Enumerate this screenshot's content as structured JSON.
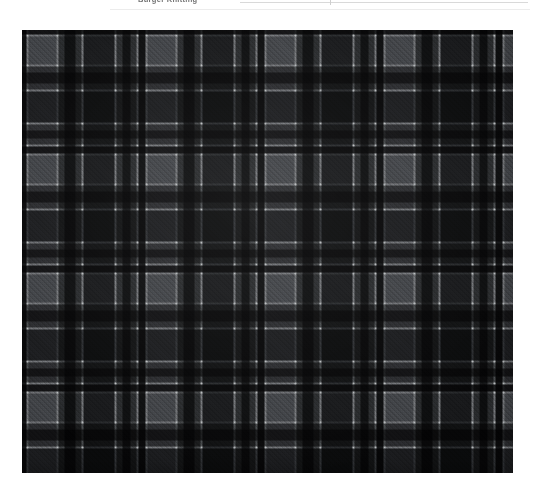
{
  "header": {
    "caption": "Burger Knitting",
    "note": ""
  },
  "swatch": {
    "name": "tartan-plaid-fabric-swatch",
    "alt_text": "Grey and black tartan plaid woven fabric swatch",
    "weave": "2/2 twill",
    "frame": {
      "x": 22,
      "y": 30,
      "width": 491,
      "height": 443
    },
    "palette": {
      "ground_mid_grey": "#6f7173",
      "light_grey": "#7e8083",
      "dark_grey": "#4c4e50",
      "charcoal": "#2c2e31",
      "black": "#17181a",
      "white_line": "#d7d9da",
      "page_background": "#ffffff"
    },
    "sett": {
      "repeat_px": 119,
      "warp_stops": [
        {
          "pos": 0,
          "color": "#17181a",
          "label": "black-guard"
        },
        {
          "pos": 4,
          "color": "#17181a",
          "label": "black-guard"
        },
        {
          "pos": 5,
          "color": "#d7d9da",
          "label": "white-pinstripe"
        },
        {
          "pos": 6,
          "color": "#d7d9da",
          "label": "white-pinstripe"
        },
        {
          "pos": 7,
          "color": "#7e8083",
          "label": "light-grey-field"
        },
        {
          "pos": 34,
          "color": "#7e8083",
          "label": "light-grey-field"
        },
        {
          "pos": 35,
          "color": "#d7d9da",
          "label": "white-pinstripe"
        },
        {
          "pos": 36,
          "color": "#d7d9da",
          "label": "white-pinstripe"
        },
        {
          "pos": 37,
          "color": "#4c4e50",
          "label": "mid-grey"
        },
        {
          "pos": 42,
          "color": "#4c4e50",
          "label": "mid-grey"
        },
        {
          "pos": 43,
          "color": "#17181a",
          "label": "black-bar"
        },
        {
          "pos": 53,
          "color": "#17181a",
          "label": "black-bar"
        },
        {
          "pos": 54,
          "color": "#4c4e50",
          "label": "mid-grey"
        },
        {
          "pos": 59,
          "color": "#4c4e50",
          "label": "mid-grey"
        },
        {
          "pos": 60,
          "color": "#d7d9da",
          "label": "white-pinstripe"
        },
        {
          "pos": 61,
          "color": "#d7d9da",
          "label": "white-pinstripe"
        },
        {
          "pos": 62,
          "color": "#2c2e31",
          "label": "charcoal-block"
        },
        {
          "pos": 92,
          "color": "#2c2e31",
          "label": "charcoal-block"
        },
        {
          "pos": 93,
          "color": "#d7d9da",
          "label": "white-pinstripe"
        },
        {
          "pos": 94,
          "color": "#d7d9da",
          "label": "white-pinstripe"
        },
        {
          "pos": 95,
          "color": "#4c4e50",
          "label": "mid-grey"
        },
        {
          "pos": 100,
          "color": "#4c4e50",
          "label": "mid-grey"
        },
        {
          "pos": 101,
          "color": "#17181a",
          "label": "black-guard"
        },
        {
          "pos": 108,
          "color": "#17181a",
          "label": "black-guard"
        },
        {
          "pos": 109,
          "color": "#4c4e50",
          "label": "mid-grey"
        },
        {
          "pos": 114,
          "color": "#4c4e50",
          "label": "mid-grey"
        },
        {
          "pos": 115,
          "color": "#d7d9da",
          "label": "white-pinstripe"
        },
        {
          "pos": 116,
          "color": "#d7d9da",
          "label": "white-pinstripe"
        },
        {
          "pos": 117,
          "color": "#17181a",
          "label": "black-guard"
        },
        {
          "pos": 119,
          "color": "#17181a",
          "label": "black-guard"
        }
      ],
      "weft_stops": [
        {
          "pos": 0,
          "color": "#17181a",
          "label": "black-guard"
        },
        {
          "pos": 4,
          "color": "#17181a",
          "label": "black-guard"
        },
        {
          "pos": 5,
          "color": "#d7d9da",
          "label": "white-pinstripe"
        },
        {
          "pos": 6,
          "color": "#d7d9da",
          "label": "white-pinstripe"
        },
        {
          "pos": 7,
          "color": "#7e8083",
          "label": "light-grey-field"
        },
        {
          "pos": 34,
          "color": "#7e8083",
          "label": "light-grey-field"
        },
        {
          "pos": 35,
          "color": "#d7d9da",
          "label": "white-pinstripe"
        },
        {
          "pos": 36,
          "color": "#d7d9da",
          "label": "white-pinstripe"
        },
        {
          "pos": 37,
          "color": "#4c4e50",
          "label": "mid-grey"
        },
        {
          "pos": 42,
          "color": "#4c4e50",
          "label": "mid-grey"
        },
        {
          "pos": 43,
          "color": "#17181a",
          "label": "black-bar"
        },
        {
          "pos": 53,
          "color": "#17181a",
          "label": "black-bar"
        },
        {
          "pos": 54,
          "color": "#4c4e50",
          "label": "mid-grey"
        },
        {
          "pos": 59,
          "color": "#4c4e50",
          "label": "mid-grey"
        },
        {
          "pos": 60,
          "color": "#d7d9da",
          "label": "white-pinstripe"
        },
        {
          "pos": 61,
          "color": "#d7d9da",
          "label": "white-pinstripe"
        },
        {
          "pos": 62,
          "color": "#2c2e31",
          "label": "charcoal-block"
        },
        {
          "pos": 92,
          "color": "#2c2e31",
          "label": "charcoal-block"
        },
        {
          "pos": 93,
          "color": "#d7d9da",
          "label": "white-pinstripe"
        },
        {
          "pos": 94,
          "color": "#d7d9da",
          "label": "white-pinstripe"
        },
        {
          "pos": 95,
          "color": "#4c4e50",
          "label": "mid-grey"
        },
        {
          "pos": 100,
          "color": "#4c4e50",
          "label": "mid-grey"
        },
        {
          "pos": 101,
          "color": "#17181a",
          "label": "black-guard"
        },
        {
          "pos": 108,
          "color": "#17181a",
          "label": "black-guard"
        },
        {
          "pos": 109,
          "color": "#4c4e50",
          "label": "mid-grey"
        },
        {
          "pos": 114,
          "color": "#4c4e50",
          "label": "mid-grey"
        },
        {
          "pos": 115,
          "color": "#d7d9da",
          "label": "white-pinstripe"
        },
        {
          "pos": 116,
          "color": "#d7d9da",
          "label": "white-pinstripe"
        },
        {
          "pos": 117,
          "color": "#17181a",
          "label": "black-guard"
        },
        {
          "pos": 119,
          "color": "#17181a",
          "label": "black-guard"
        }
      ]
    }
  }
}
